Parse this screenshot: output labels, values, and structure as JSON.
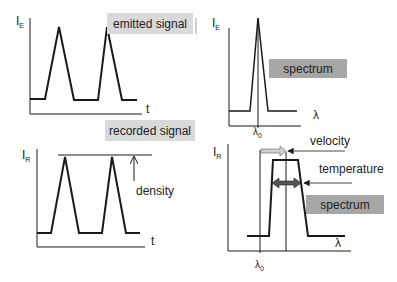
{
  "panels": {
    "emitted_time": {
      "y_label": "I",
      "y_sub": "E",
      "x_label": "t",
      "caption": "emitted signal"
    },
    "emitted_spectrum": {
      "y_label": "I",
      "y_sub": "E",
      "x_label": "λ",
      "x_tick": "λ",
      "x_tick_sub": "0",
      "caption": "spectrum"
    },
    "recorded_time": {
      "y_label": "I",
      "y_sub": "R",
      "x_label": "t",
      "caption": "recorded signal",
      "annotation": "density"
    },
    "recorded_spectrum": {
      "y_label": "I",
      "y_sub": "R",
      "x_label": "λ",
      "x_tick": "λ",
      "x_tick_sub": "0",
      "caption": "spectrum",
      "annotations": [
        "velocity",
        "temperature"
      ]
    }
  },
  "colors": {
    "line": "#1a1a1a",
    "label_box_light": "#d9d9d9",
    "label_box_dark": "#a6a6a6",
    "arrow_light": "#d0d0d0",
    "arrow_dark": "#555555"
  }
}
